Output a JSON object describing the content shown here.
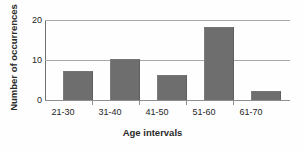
{
  "chart_data": {
    "type": "bar",
    "title": "",
    "categories": [
      "21-30",
      "31-40",
      "41-50",
      "51-60",
      "61-70"
    ],
    "values": [
      7,
      10,
      6,
      18,
      2
    ],
    "xlabel": "Age intervals",
    "ylabel": "Number of occurrences",
    "ylim": [
      0,
      20
    ],
    "yticks": [
      0,
      10,
      20
    ],
    "ytick_labels": [
      "0",
      "10",
      "20"
    ],
    "grid": true,
    "legend": false,
    "bar_color": "#6e6e6e",
    "gridline_color": "#a8a8a8",
    "axis_color": "#6f6f6f",
    "background_color": "#ffffff"
  }
}
